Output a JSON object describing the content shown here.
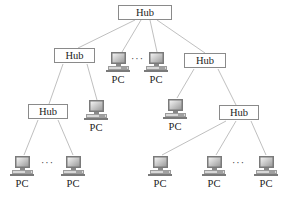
{
  "diagram": {
    "type": "tree-topology",
    "hub_label": "Hub",
    "pc_label": "PC",
    "ellipsis": "···",
    "line_color": "#b8b8b8",
    "hubs": [
      {
        "id": "root",
        "label": "Hub"
      },
      {
        "id": "left-1",
        "label": "Hub"
      },
      {
        "id": "right-1",
        "label": "Hub"
      },
      {
        "id": "left-2",
        "label": "Hub"
      },
      {
        "id": "right-2",
        "label": "Hub"
      }
    ],
    "pcs": [
      {
        "id": "root-pc-1",
        "label": "PC",
        "parent": "root"
      },
      {
        "id": "root-pc-2",
        "label": "PC",
        "parent": "root"
      },
      {
        "id": "left1-pc",
        "label": "PC",
        "parent": "left-1"
      },
      {
        "id": "right1-pc",
        "label": "PC",
        "parent": "right-1"
      },
      {
        "id": "left2-pc-1",
        "label": "PC",
        "parent": "left-2"
      },
      {
        "id": "left2-pc-2",
        "label": "PC",
        "parent": "left-2"
      },
      {
        "id": "right2-pc-1",
        "label": "PC",
        "parent": "right-2"
      },
      {
        "id": "right2-pc-2",
        "label": "PC",
        "parent": "right-2"
      },
      {
        "id": "right2-pc-3",
        "label": "PC",
        "parent": "right-2"
      }
    ],
    "edges": [
      [
        "root",
        "left-1"
      ],
      [
        "root",
        "root-pc-1"
      ],
      [
        "root",
        "root-pc-2"
      ],
      [
        "root",
        "right-1"
      ],
      [
        "left-1",
        "left-2"
      ],
      [
        "left-1",
        "left1-pc"
      ],
      [
        "right-1",
        "right1-pc"
      ],
      [
        "right-1",
        "right-2"
      ],
      [
        "left-2",
        "left2-pc-1"
      ],
      [
        "left-2",
        "left2-pc-2"
      ],
      [
        "right-2",
        "right2-pc-1"
      ],
      [
        "right-2",
        "right2-pc-2"
      ],
      [
        "right-2",
        "right2-pc-3"
      ]
    ]
  }
}
